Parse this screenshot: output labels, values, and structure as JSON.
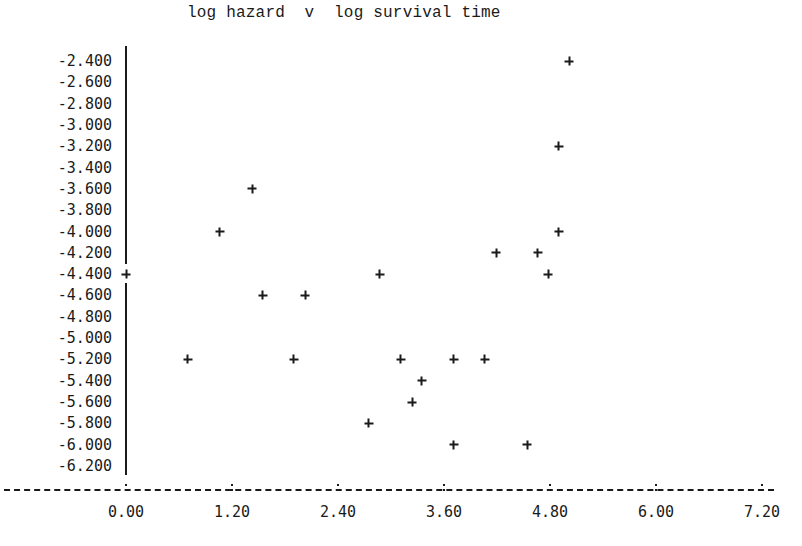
{
  "chart_data": {
    "type": "scatter",
    "title": "log hazard  v  log survival time",
    "xlabel": "log survival time",
    "ylabel": "log hazard",
    "xlim": [
      0.0,
      7.2
    ],
    "ylim": [
      -6.2,
      -2.4
    ],
    "grid": false,
    "legend": null,
    "x_ticks": [
      "0.00",
      "1.20",
      "2.40",
      "3.60",
      "4.80",
      "6.00",
      "7.20"
    ],
    "y_ticks": [
      "-2.400",
      "-2.600",
      "-2.800",
      "-3.000",
      "-3.200",
      "-3.400",
      "-3.600",
      "-3.800",
      "-4.000",
      "-4.200",
      "-4.400",
      "-4.600",
      "-4.800",
      "-5.000",
      "-5.200",
      "-5.400",
      "-5.600",
      "-5.800",
      "-6.000",
      "-6.200"
    ],
    "marker": "+",
    "points": [
      {
        "x": 5.02,
        "y": -2.4
      },
      {
        "x": 4.9,
        "y": -3.2
      },
      {
        "x": 1.43,
        "y": -3.6
      },
      {
        "x": 1.06,
        "y": -4.0
      },
      {
        "x": 4.9,
        "y": -4.0
      },
      {
        "x": 4.19,
        "y": -4.2
      },
      {
        "x": 4.66,
        "y": -4.2
      },
      {
        "x": 0.0,
        "y": -4.4
      },
      {
        "x": 2.87,
        "y": -4.4
      },
      {
        "x": 4.78,
        "y": -4.4
      },
      {
        "x": 1.55,
        "y": -4.6
      },
      {
        "x": 2.03,
        "y": -4.6
      },
      {
        "x": 0.7,
        "y": -5.2
      },
      {
        "x": 1.9,
        "y": -5.2
      },
      {
        "x": 3.11,
        "y": -5.2
      },
      {
        "x": 3.71,
        "y": -5.2
      },
      {
        "x": 4.06,
        "y": -5.2
      },
      {
        "x": 3.35,
        "y": -5.4
      },
      {
        "x": 3.24,
        "y": -5.6
      },
      {
        "x": 2.75,
        "y": -5.8
      },
      {
        "x": 3.71,
        "y": -6.0
      },
      {
        "x": 4.54,
        "y": -6.0
      }
    ]
  },
  "x_axis_rule": "----------:---------:---------:---------:---------:---------:---------:"
}
